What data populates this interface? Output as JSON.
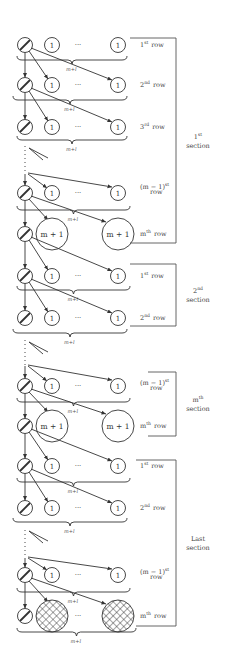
{
  "diagram": {
    "node_small_label": "1",
    "node_big_label": "m + 1",
    "ellipsis": "···",
    "brace_label": "m+l",
    "colors": {
      "stroke": "#333333",
      "text": "#444444",
      "bracket": "#555555"
    },
    "sections": [
      {
        "label_line1": "1",
        "label_sup": "st",
        "label_line2": "section",
        "rows": [
          {
            "ord": "1",
            "sup": "st",
            "word": "row"
          },
          {
            "ord": "2",
            "sup": "nd",
            "word": "row"
          },
          {
            "ord": "3",
            "sup": "rd",
            "word": "row"
          },
          {
            "ord": "(m − 1)",
            "sup": "st",
            "word": "row"
          },
          {
            "ord": "m",
            "sup": "th",
            "word": "row"
          }
        ]
      },
      {
        "label_line1": "2",
        "label_sup": "nd",
        "label_line2": "section",
        "rows": [
          {
            "ord": "1",
            "sup": "st",
            "word": "row"
          },
          {
            "ord": "2",
            "sup": "nd",
            "word": "row"
          }
        ]
      },
      {
        "label_line1": "m",
        "label_sup": "th",
        "label_line2": "section",
        "rows": [
          {
            "ord": "(m − 1)",
            "sup": "st",
            "word": "row"
          },
          {
            "ord": "m",
            "sup": "th",
            "word": "row"
          }
        ]
      },
      {
        "label_line1": "Last",
        "label_sup": "",
        "label_line2": "section",
        "rows": [
          {
            "ord": "1",
            "sup": "st",
            "word": "row"
          },
          {
            "ord": "2",
            "sup": "nd",
            "word": "row"
          },
          {
            "ord": "(m − 1)",
            "sup": "st",
            "word": "row"
          },
          {
            "ord": "m",
            "sup": "th",
            "word": "row"
          }
        ]
      }
    ]
  }
}
